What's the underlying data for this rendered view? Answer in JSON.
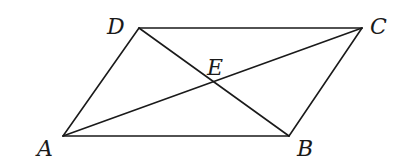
{
  "diagram": {
    "type": "parallelogram-with-diagonals",
    "points": {
      "A": {
        "label": "A",
        "x": 63,
        "y": 136,
        "lx": 37,
        "ly": 156
      },
      "B": {
        "label": "B",
        "x": 289,
        "y": 136,
        "lx": 297,
        "ly": 156
      },
      "C": {
        "label": "C",
        "x": 362,
        "y": 28,
        "lx": 370,
        "ly": 34
      },
      "D": {
        "label": "D",
        "x": 139,
        "y": 28,
        "lx": 107,
        "ly": 34
      },
      "E": {
        "label": "E",
        "x": 214,
        "y": 83,
        "lx": 207,
        "ly": 75
      }
    },
    "segments": [
      {
        "name": "side-AB",
        "from": "A",
        "to": "B"
      },
      {
        "name": "side-BC",
        "from": "B",
        "to": "C"
      },
      {
        "name": "side-CD",
        "from": "C",
        "to": "D"
      },
      {
        "name": "side-DA",
        "from": "D",
        "to": "A"
      },
      {
        "name": "diagonal-AC",
        "from": "A",
        "to": "C"
      },
      {
        "name": "diagonal-BD",
        "from": "B",
        "to": "D"
      }
    ],
    "line_color": "#1a1a1a"
  }
}
